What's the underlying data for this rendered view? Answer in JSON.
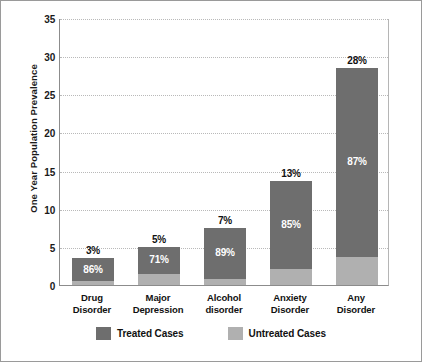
{
  "chart_data": {
    "type": "bar",
    "subtype": "stacked",
    "title": "",
    "xlabel": "",
    "ylabel": "One Year Population Prevalence",
    "ylim": [
      0,
      35
    ],
    "yticks": [
      35,
      30,
      25,
      20,
      15,
      10,
      5,
      0
    ],
    "grid": true,
    "legend_position": "bottom",
    "categories": [
      "Drug Disorder",
      "Major Depression",
      "Alcohol disorder",
      "Anxiety Disorder",
      "Any Disorder"
    ],
    "category_lines": [
      [
        "Drug",
        "Disorder"
      ],
      [
        "Major",
        "Depression"
      ],
      [
        "Alcohol",
        "disorder"
      ],
      [
        "Anxiety",
        "Disorder"
      ],
      [
        "Any",
        "Disorder"
      ]
    ],
    "totals": [
      3.5,
      5.0,
      7.5,
      13.7,
      28.5
    ],
    "total_labels": [
      "3%",
      "5%",
      "7%",
      "13%",
      "28%"
    ],
    "series": [
      {
        "name": "Treated Cases",
        "color": "#6e6e6e",
        "share_labels": [
          "86%",
          "71%",
          "89%",
          "85%",
          "87%"
        ],
        "shares": [
          86,
          71,
          89,
          85,
          87
        ]
      },
      {
        "name": "Untreated Cases",
        "color": "#b0b0b0",
        "share_labels": [
          "14%",
          "29%",
          "11%",
          "15%",
          "13%"
        ],
        "shares": [
          14,
          29,
          11,
          15,
          13
        ]
      }
    ]
  },
  "legend": {
    "items": [
      {
        "label": "Treated Cases",
        "color": "#6e6e6e"
      },
      {
        "label": "Untreated Cases",
        "color": "#b0b0b0"
      }
    ]
  },
  "colors": {
    "treated": "#6e6e6e",
    "untreated": "#b0b0b0",
    "axis": "#8c8c8c",
    "grid": "#b9b9b9",
    "text": "#111111",
    "frame": "#9a9a9a"
  }
}
